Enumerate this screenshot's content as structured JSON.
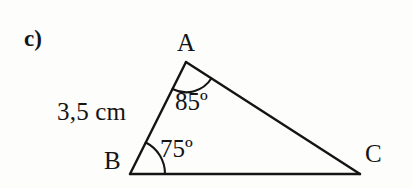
{
  "figure": {
    "item_label": "c)",
    "background_color": "#fdfdfc",
    "stroke_color": "#141414",
    "canvas": {
      "width": 413,
      "height": 188
    },
    "vertices": {
      "A": {
        "label": "A",
        "x": 186,
        "y": 62
      },
      "B": {
        "label": "B",
        "x": 130,
        "y": 174
      },
      "C": {
        "label": "C",
        "x": 360,
        "y": 174
      }
    },
    "angles": {
      "at_A": {
        "label": "85º",
        "value": 85,
        "unit": "degrees"
      },
      "at_B": {
        "label": "75º",
        "value": 75,
        "unit": "degrees"
      }
    },
    "sides": {
      "AB": {
        "label": "3,5 cm",
        "value": "3,5",
        "unit": "cm"
      }
    }
  }
}
